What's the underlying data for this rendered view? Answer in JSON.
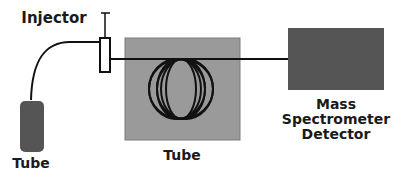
{
  "labels": {
    "injector": "Injector",
    "left_tube": "Tube",
    "center_tube": "Tube",
    "detector_line1": "Mass",
    "detector_line2": "Spectrometer",
    "detector_line3": "Detector"
  },
  "colors": {
    "dark_component": "#555555",
    "coil_box": "#9a9a9a",
    "line": "#111111",
    "background": "#ffffff"
  },
  "coil": {
    "loops": 6
  }
}
